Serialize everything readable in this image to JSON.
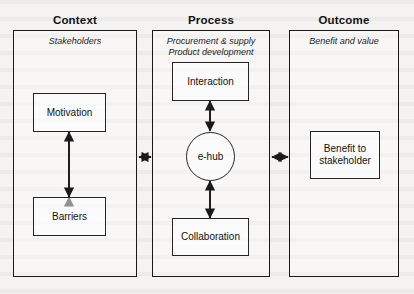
{
  "figure": {
    "type": "block-flow-diagram",
    "columns": [
      {
        "heading": "Context",
        "subtitle": "Stakeholders",
        "nodes": [
          {
            "label": "Motivation"
          },
          {
            "label": "Barriers"
          }
        ]
      },
      {
        "heading": "Process",
        "subtitle": "Procurement & supply\nProduct development",
        "nodes": [
          {
            "label": "Interaction"
          },
          {
            "label": "e-hub",
            "shape": "circle"
          },
          {
            "label": "Collaboration"
          }
        ]
      },
      {
        "heading": "Outcome",
        "subtitle": "Benefit and value",
        "nodes": [
          {
            "label": "Benefit to\nstakeholder"
          }
        ]
      }
    ],
    "connectors": [
      {
        "name": "motivation-barriers",
        "orientation": "vertical",
        "heads": "both"
      },
      {
        "name": "interaction-ehub",
        "orientation": "vertical",
        "heads": "both"
      },
      {
        "name": "ehub-collaboration",
        "orientation": "vertical",
        "heads": "both"
      },
      {
        "name": "context-process",
        "orientation": "horizontal",
        "heads": "both"
      },
      {
        "name": "process-outcome",
        "orientation": "horizontal",
        "heads": "both"
      }
    ],
    "colors": {
      "stroke": "#1a1a1a",
      "text": "#111111",
      "page": "#f4f3f1"
    }
  }
}
